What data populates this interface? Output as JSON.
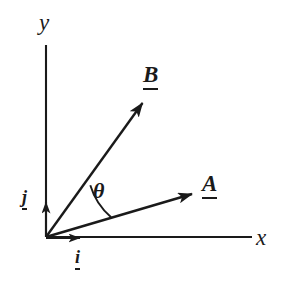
{
  "figure": {
    "kind": "vector-diagram",
    "width": 290,
    "height": 282,
    "background_color": "#ffffff",
    "ink_color": "#1a1a1a"
  },
  "axes": {
    "x_label": "x",
    "y_label": "y",
    "origin": {
      "x": 46,
      "y": 237
    },
    "x_axis_end": {
      "x": 252,
      "y": 237
    },
    "y_axis_top": {
      "x": 46,
      "y": 45
    }
  },
  "vectors": [
    {
      "id": "B",
      "label": "B",
      "notation": "underlined",
      "tail": {
        "x": 46,
        "y": 237
      },
      "tip": {
        "x": 146,
        "y": 98
      },
      "label_position": {
        "x": 143,
        "y": 63
      }
    },
    {
      "id": "A",
      "label": "A",
      "notation": "underlined",
      "tail": {
        "x": 46,
        "y": 237
      },
      "tip": {
        "x": 198,
        "y": 192
      },
      "label_position": {
        "x": 202,
        "y": 172
      }
    }
  ],
  "unit_vectors": [
    {
      "id": "i",
      "label": "i",
      "notation": "underlined",
      "tail": {
        "x": 46,
        "y": 237
      },
      "tip": {
        "x": 83,
        "y": 237
      },
      "direction": "x",
      "label_position": {
        "x": 75,
        "y": 248
      }
    },
    {
      "id": "j",
      "label": "j",
      "notation": "underlined",
      "tail": {
        "x": 46,
        "y": 237
      },
      "tip": {
        "x": 46,
        "y": 199
      },
      "direction": "y",
      "label_position": {
        "x": 22,
        "y": 188
      }
    }
  ],
  "angle": {
    "symbol": "θ",
    "between": [
      "A",
      "B"
    ],
    "arc_radius": 68,
    "label_position": {
      "x": 93,
      "y": 180
    }
  }
}
